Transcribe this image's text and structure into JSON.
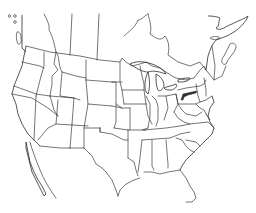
{
  "map": {
    "type": "outline-map",
    "region": "North America (United States, southern Canada, northern Mexico)",
    "style": "black line outline on white",
    "colors": {
      "background": "#ffffff",
      "line": "#3a3a3a",
      "highlight": "#2a2a2a"
    },
    "highlighted_region": {
      "description": "shaded area along southern New York / northern Pennsylvania",
      "color": "#2a2a2a"
    },
    "labels": []
  }
}
